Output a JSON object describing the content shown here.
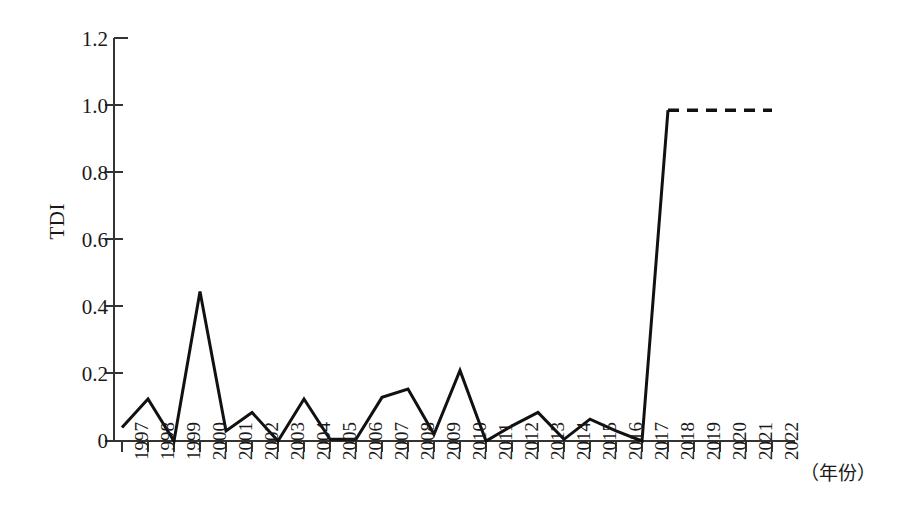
{
  "chart_data": {
    "type": "line",
    "title": "",
    "xlabel": "（年份）",
    "ylabel": "TDI",
    "ylim": [
      0,
      1.2
    ],
    "ytick_labels": [
      "0",
      "0.2",
      "0.4",
      "0.6",
      "0.8",
      "1.0",
      "1.2"
    ],
    "ytick_values": [
      0,
      0.2,
      0.4,
      0.6,
      0.8,
      1.0,
      1.2
    ],
    "grid": false,
    "legend": null,
    "categories": [
      "1997",
      "1998",
      "1999",
      "2000",
      "2001",
      "2002",
      "2003",
      "2004",
      "2005",
      "2006",
      "2007",
      "2008",
      "2009",
      "2010",
      "2011",
      "2012",
      "2013",
      "2014",
      "2015",
      "2016",
      "2017",
      "2018",
      "2019",
      "2020",
      "2021",
      "2022"
    ],
    "series": [
      {
        "name": "TDI",
        "style": "solid",
        "x": [
          "1997",
          "1998",
          "1999",
          "2000",
          "2001",
          "2002",
          "2003",
          "2004",
          "2005",
          "2006",
          "2007",
          "2008",
          "2009",
          "2010",
          "2011",
          "2012",
          "2013",
          "2014",
          "2015",
          "2016",
          "2017",
          "2018"
        ],
        "values": [
          0.04,
          0.125,
          0.0,
          0.445,
          0.03,
          0.085,
          0.0,
          0.125,
          0.005,
          0.005,
          0.13,
          0.155,
          0.02,
          0.21,
          0.0,
          0.045,
          0.085,
          0.005,
          0.065,
          0.03,
          0.0,
          0.985
        ]
      },
      {
        "name": "TDI projected",
        "style": "dashed",
        "x": [
          "2018",
          "2019",
          "2020",
          "2021",
          "2022"
        ],
        "values": [
          0.985,
          0.985,
          0.985,
          0.985,
          0.985
        ]
      }
    ],
    "annotations": [
      "Line is solid from 1997 to 2018 and dashed (flat at 0.985) from 2018 to 2022."
    ],
    "colors": {
      "line": "#111111",
      "axis": "#333333",
      "background": "#ffffff"
    }
  }
}
